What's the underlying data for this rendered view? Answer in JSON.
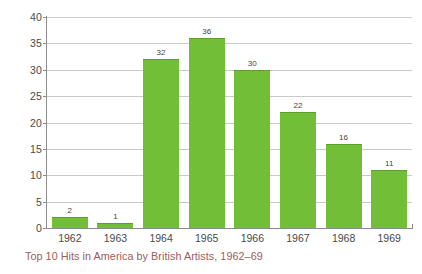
{
  "chart_data": {
    "type": "bar",
    "title": "",
    "caption": "Top 10 Hits in America by British Artists, 1962–69",
    "categories": [
      "1962",
      "1963",
      "1964",
      "1965",
      "1966",
      "1967",
      "1968",
      "1969"
    ],
    "values": [
      2,
      1,
      32,
      36,
      30,
      22,
      16,
      11
    ],
    "data_labels": [
      "2",
      "1",
      "32",
      "36",
      "30",
      "22",
      "16",
      "11"
    ],
    "xlabel": "",
    "ylabel": "",
    "ylim": [
      0,
      40
    ],
    "yticks": [
      "0",
      "5",
      "10",
      "15",
      "20",
      "25",
      "30",
      "35",
      "40"
    ],
    "ytick_values": [
      0,
      5,
      10,
      15,
      20,
      25,
      30,
      35,
      40
    ],
    "grid": true,
    "grid_axis": "y",
    "legend": false,
    "legend_position": "none",
    "series": [
      {
        "name": "Top 10 Hits",
        "values": [
          2,
          1,
          32,
          36,
          30,
          22,
          16,
          11
        ]
      }
    ]
  },
  "colors": {
    "bar_fill": "#72bf37",
    "bar_edge": "#5d9e2c",
    "gridline": "#c9c9c9",
    "axis": "#8d8d8d",
    "tick_text": "#4a4a4a",
    "data_label_text": "#3f3f3f",
    "caption_text": "#9d5c5c",
    "background": "#ffffff"
  }
}
